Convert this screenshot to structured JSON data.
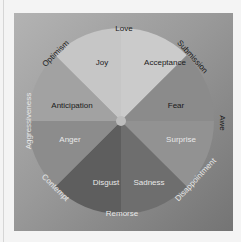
{
  "diagram": {
    "center": [
      121,
      121
    ],
    "petals": [
      {
        "label": "Joy",
        "color": "#c9c9c9"
      },
      {
        "label": "Acceptance",
        "color": "#cdcdcd"
      },
      {
        "label": "Fear",
        "color": "#8c8c8c"
      },
      {
        "label": "Surprise",
        "color": "#959595"
      },
      {
        "label": "Sadness",
        "color": "#6f6f6f"
      },
      {
        "label": "Disgust",
        "color": "#5f5f5f"
      },
      {
        "label": "Anger",
        "color": "#8e8e8e"
      },
      {
        "label": "Anticipation",
        "color": "#a3a3a3"
      }
    ],
    "dyads": [
      {
        "label": "Love"
      },
      {
        "label": "Submission"
      },
      {
        "label": "Awe"
      },
      {
        "label": "Disappointment"
      },
      {
        "label": "Remorse"
      },
      {
        "label": "Contempt"
      },
      {
        "label": "Aggressiveness"
      },
      {
        "label": "Optimism"
      }
    ],
    "colors": {
      "background": "#f4f4f4",
      "frame_light": "#b3b3b3",
      "frame_dark": "#747474",
      "hub": "#bdbdbd"
    }
  }
}
